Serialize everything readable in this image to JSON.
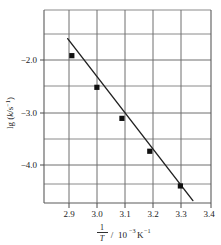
{
  "chart_data": {
    "type": "scatter",
    "title": "",
    "subtitle": "",
    "xlabel": "1/T / 10^-3 K^-1",
    "ylabel": "lg (k/s^-1)",
    "xlabel_parts": {
      "numerator": "1",
      "denominator": "T",
      "slash": "/",
      "base": "10",
      "base_exp": "−3",
      "unit": "K",
      "unit_exp": "−1"
    },
    "ylabel_parts": {
      "prefix": "lg (",
      "variable": "k",
      "slash": "/",
      "unit": "s",
      "unit_exp": "−1",
      "suffix": ")"
    },
    "grid": true,
    "legend": null,
    "xlim": [
      2.86,
      3.46
    ],
    "ylim": [
      -4.72,
      -1.55
    ],
    "xticks": [
      "2.9",
      "3.0",
      "3.1",
      "3.2",
      "3.3",
      "3.4"
    ],
    "xtick_values": [
      2.9,
      3.0,
      3.1,
      3.2,
      3.3,
      3.4
    ],
    "yticks": [
      "−2.0",
      "−3.0",
      "−4.0"
    ],
    "ytick_values": [
      -2.0,
      -3.0,
      -4.0
    ],
    "x": [
      2.96,
      3.05,
      3.14,
      3.24,
      3.35
    ],
    "y": [
      -2.3,
      -2.82,
      -3.33,
      -3.87,
      -4.44
    ],
    "points": [
      {
        "x": 2.96,
        "y": -2.3
      },
      {
        "x": 3.05,
        "y": -2.82
      },
      {
        "x": 3.14,
        "y": -3.33
      },
      {
        "x": 3.24,
        "y": -3.87
      },
      {
        "x": 3.35,
        "y": -4.44
      }
    ],
    "fit_line": {
      "x_start": 2.945,
      "y_start": -2.02,
      "x_end": 3.395,
      "y_end": -4.68
    },
    "marker": "square",
    "marker_color": "#111111",
    "line_color": "#222222",
    "grid_color": "#7a7a7a",
    "axis_color": "#5a5a5a",
    "background": "#ffffff"
  }
}
